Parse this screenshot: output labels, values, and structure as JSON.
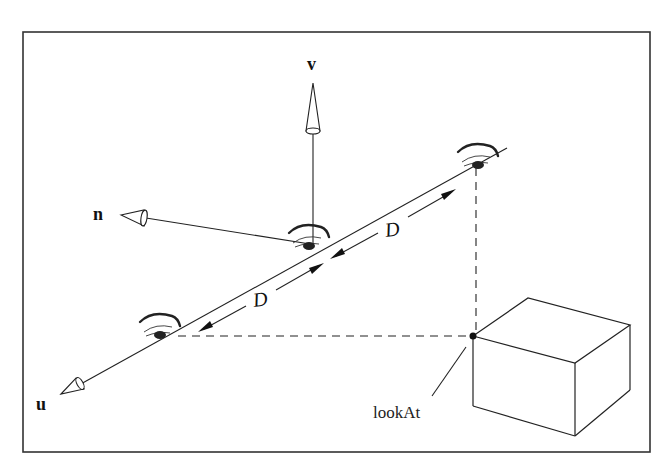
{
  "figure": {
    "type": "camera-coordinate-diagram",
    "frame_color": "#333333",
    "line_color": "#222222"
  },
  "axes": {
    "v": {
      "label": "v",
      "icon": "hollow-cone-arrow"
    },
    "n": {
      "label": "n",
      "icon": "hollow-cone-arrow"
    },
    "u": {
      "label": "u",
      "icon": "hollow-cone-arrow"
    }
  },
  "eyes": [
    {
      "name": "eye-upper-right",
      "icon": "eye-icon"
    },
    {
      "name": "eye-center",
      "icon": "eye-icon"
    },
    {
      "name": "eye-lower-left",
      "icon": "eye-icon"
    }
  ],
  "distances": [
    {
      "label": "D",
      "between": "eye-center and eye-upper-right"
    },
    {
      "label": "D",
      "between": "eye-lower-left and eye-center"
    }
  ],
  "target": {
    "label": "lookAt",
    "marker": "filled-dot",
    "object": "cube"
  }
}
